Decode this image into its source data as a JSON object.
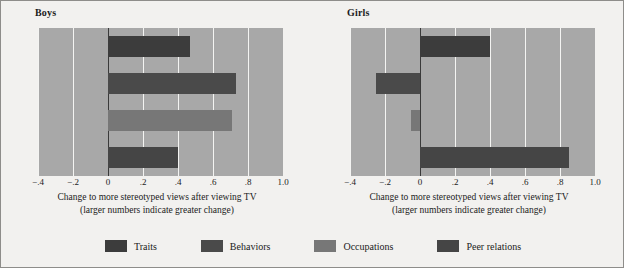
{
  "chart_data": {
    "type": "bar",
    "orientation": "horizontal",
    "title": "",
    "xlabel": "Change to more stereotyped views after viewing TV",
    "xlabel_sub": "(larger numbers indicate greater change)",
    "ylabel": "",
    "xlim": [
      -0.4,
      1.0
    ],
    "grid": true,
    "legend_position": "bottom",
    "tick_labels": [
      "−.4",
      "−.2",
      "0",
      ".2",
      ".4",
      ".6",
      ".8",
      "1.0"
    ],
    "tick_values": [
      -0.4,
      -0.2,
      0,
      0.2,
      0.4,
      0.6,
      0.8,
      1.0
    ],
    "categories": [
      "Traits",
      "Behaviors",
      "Occupations",
      "Peer relations"
    ],
    "panels": [
      {
        "name": "Boys",
        "values": [
          0.47,
          0.73,
          0.71,
          0.4
        ]
      },
      {
        "name": "Girls",
        "values": [
          0.4,
          -0.25,
          -0.05,
          0.85
        ]
      }
    ],
    "series_colors": [
      "#3c3c3c",
      "#4a4a4a",
      "#777777",
      "#454545"
    ],
    "plot_background": "#a8a8a8",
    "figure_background": "#f2f1ef",
    "gridline_color": "#f4f4f2",
    "zeroline_color": "#3a3a3a",
    "text_color": "#1b1b1b"
  },
  "legend": {
    "items": [
      {
        "label": "Traits",
        "color": "#3c3c3c"
      },
      {
        "label": "Behaviors",
        "color": "#4a4a4a"
      },
      {
        "label": "Occupations",
        "color": "#777777"
      },
      {
        "label": "Peer relations",
        "color": "#454545"
      }
    ]
  }
}
